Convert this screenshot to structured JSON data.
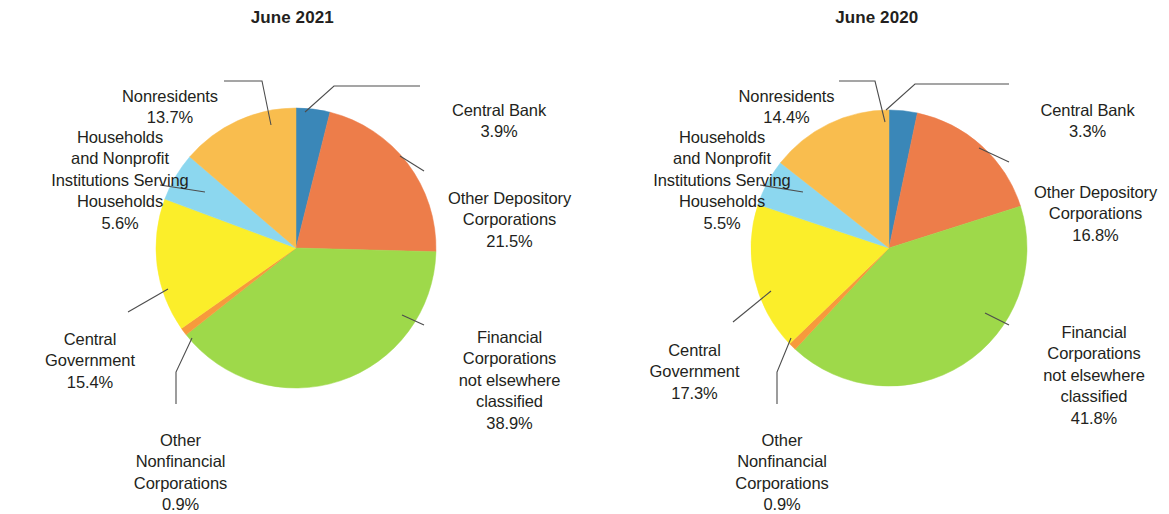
{
  "background_color": "#ffffff",
  "text_color": "#231f20",
  "leader_line_color": "#4d4d4d",
  "palette": {
    "central_bank": "#3a87b8",
    "other_depository_corporations": "#ed7d4a",
    "financial_corporations_nec": "#9ed94a",
    "other_nonfinancial_corporations": "#f79a3c",
    "central_government": "#fbee2a",
    "households_npish": "#8cd7ef",
    "nonresidents": "#f9bd4e"
  },
  "chart_data": [
    {
      "type": "pie",
      "title": "June 2021",
      "categories": [
        "Central Bank",
        "Other Depository Corporations",
        "Financial Corporations not elsewhere classified",
        "Other Nonfinancial Corporations",
        "Central Government",
        "Households and Nonprofit Institutions Serving Households",
        "Nonresidents"
      ],
      "values": [
        3.9,
        21.5,
        38.9,
        0.9,
        15.4,
        5.6,
        13.7
      ],
      "value_labels": [
        "3.9%",
        "21.5%",
        "38.9%",
        "0.9%",
        "15.4%",
        "5.6%",
        "13.7%"
      ],
      "colors": [
        "#3a87b8",
        "#ed7d4a",
        "#9ed94a",
        "#f79a3c",
        "#fbee2a",
        "#8cd7ef",
        "#f9bd4e"
      ],
      "start_angle_deg": 0,
      "direction": "clockwise",
      "legend": "callout-labels",
      "labels": [
        {
          "key": "nonresidents",
          "name": "Nonresidents",
          "pct": "13.7%",
          "align": "center"
        },
        {
          "key": "households",
          "name": "Households\nand Nonprofit\nInstitutions Serving\nHouseholds",
          "pct": "5.6%",
          "align": "center"
        },
        {
          "key": "central-government",
          "name": "Central\nGovernment",
          "pct": "15.4%",
          "align": "center"
        },
        {
          "key": "other-nonfinancial",
          "name": "Other\nNonfinancial\nCorporations",
          "pct": "0.9%",
          "align": "center"
        },
        {
          "key": "central-bank",
          "name": "Central Bank",
          "pct": "3.9%",
          "align": "center"
        },
        {
          "key": "other-depository",
          "name": "Other Depository\nCorporations",
          "pct": "21.5%",
          "align": "center"
        },
        {
          "key": "financial-corps",
          "name": "Financial\nCorporations\nnot elsewhere\nclassified",
          "pct": "38.9%",
          "align": "center"
        }
      ]
    },
    {
      "type": "pie",
      "title": "June 2020",
      "categories": [
        "Central Bank",
        "Other Depository Corporations",
        "Financial Corporations not elsewhere classified",
        "Other Nonfinancial Corporations",
        "Central Government",
        "Households and Nonprofit Institutions Serving Households",
        "Nonresidents"
      ],
      "values": [
        3.3,
        16.8,
        41.8,
        0.9,
        17.3,
        5.5,
        14.4
      ],
      "value_labels": [
        "3.3%",
        "16.8%",
        "41.8%",
        "0.9%",
        "17.3%",
        "5.5%",
        "14.4%"
      ],
      "colors": [
        "#3a87b8",
        "#ed7d4a",
        "#9ed94a",
        "#f79a3c",
        "#fbee2a",
        "#8cd7ef",
        "#f9bd4e"
      ],
      "start_angle_deg": 0,
      "direction": "clockwise",
      "legend": "callout-labels",
      "labels": [
        {
          "key": "nonresidents",
          "name": "Nonresidents",
          "pct": "14.4%",
          "align": "center"
        },
        {
          "key": "households",
          "name": "Households\nand Nonprofit\nInstitutions Serving\nHouseholds",
          "pct": "5.5%",
          "align": "center"
        },
        {
          "key": "central-government",
          "name": "Central\nGovernment",
          "pct": "17.3%",
          "align": "center"
        },
        {
          "key": "other-nonfinancial",
          "name": "Other\nNonfinancial\nCorporations",
          "pct": "0.9%",
          "align": "center"
        },
        {
          "key": "central-bank",
          "name": "Central Bank",
          "pct": "3.3%",
          "align": "center"
        },
        {
          "key": "other-depository",
          "name": "Other Depository\nCorporations",
          "pct": "16.8%",
          "align": "center"
        },
        {
          "key": "financial-corps",
          "name": "Financial\nCorporations\nnot elsewhere\nclassified",
          "pct": "41.8%",
          "align": "center"
        }
      ]
    }
  ]
}
